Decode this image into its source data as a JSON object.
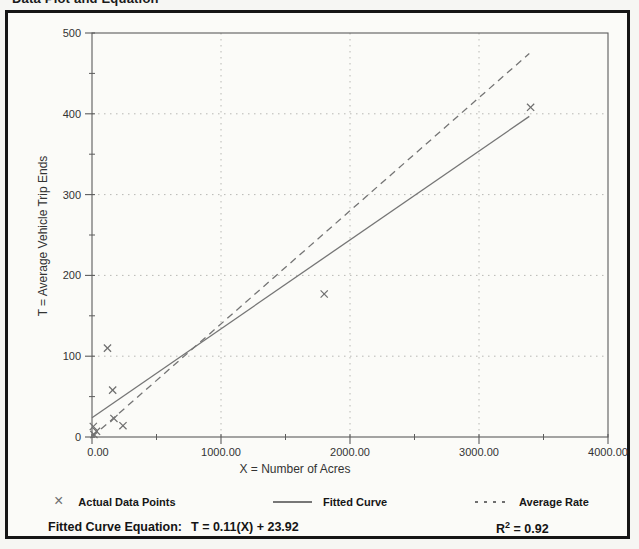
{
  "chart_data": {
    "type": "scatter",
    "title": "Data Plot and Equation",
    "xlabel": "X = Number of Acres",
    "ylabel": "T = Average Vehicle Trip Ends",
    "xlim": [
      0,
      4000
    ],
    "ylim": [
      0,
      500
    ],
    "x_ticks": [
      0,
      1000,
      2000,
      3000,
      4000
    ],
    "x_tick_labels": [
      "0.00",
      "1000.00",
      "2000.00",
      "3000.00",
      "4000.00"
    ],
    "y_ticks": [
      0,
      100,
      200,
      300,
      400,
      500
    ],
    "y_tick_labels": [
      "0",
      "100",
      "200",
      "300",
      "400",
      "500"
    ],
    "x_minor_tick_step": 500,
    "y_minor_tick_step": 50,
    "grid": {
      "style": "dotted",
      "horizontal_at": [
        100,
        200,
        300,
        400
      ],
      "vertical_at": [
        1000,
        2000,
        3000
      ]
    },
    "series": [
      {
        "name": "Actual Data Points",
        "type": "scatter",
        "marker": "x",
        "points": [
          [
            10,
            13
          ],
          [
            35,
            7
          ],
          [
            15,
            3
          ],
          [
            120,
            110
          ],
          [
            160,
            58
          ],
          [
            170,
            23
          ],
          [
            240,
            14
          ],
          [
            1800,
            177
          ],
          [
            3400,
            408
          ]
        ]
      },
      {
        "name": "Fitted Curve",
        "type": "line",
        "style": "solid",
        "equation": "T = 0.11(X) + 23.92",
        "slope": 0.11,
        "intercept": 23.92,
        "x_start": 0,
        "x_end": 3390
      },
      {
        "name": "Average Rate",
        "type": "line",
        "style": "dashed",
        "slope": 0.14,
        "intercept": 0,
        "x_start": 0,
        "x_end": 3390
      }
    ]
  },
  "legend": {
    "actual_data_points": "Actual Data Points",
    "fitted_curve": "Fitted Curve",
    "average_rate": "Average Rate"
  },
  "footer": {
    "equation_label": "Fitted Curve Equation:",
    "equation_value": "T = 0.11(X) + 23.92",
    "r_squared_base": "R",
    "r_squared_exp": "2",
    "r_squared_value": " = 0.92"
  }
}
